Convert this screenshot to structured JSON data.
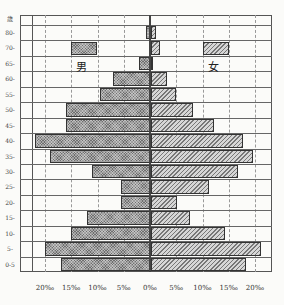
{
  "chart_data": {
    "type": "bar",
    "subtype": "population-pyramid",
    "title": "",
    "xlabel": "",
    "ylabel": "歳",
    "x_unit": "‰",
    "xlim": [
      -20,
      20
    ],
    "x_ticks": [
      "20‰",
      "15‰",
      "10‰",
      "5‰",
      "0‰",
      "5‰",
      "10‰",
      "15‰",
      "20‰"
    ],
    "grid": true,
    "legend": [
      {
        "name": "男",
        "pattern": "crosshatch-dark"
      },
      {
        "name": "女",
        "pattern": "diagonal-light"
      }
    ],
    "categories": [
      "80-",
      "70-",
      "65-",
      "60-",
      "55-",
      "50-",
      "45-",
      "40-",
      "35-",
      "30-",
      "25-",
      "20-",
      "15-",
      "10-",
      "5-",
      "0-5"
    ],
    "series": [
      {
        "name": "男",
        "side": "left",
        "values": [
          0.8,
          0.0,
          2.1,
          7.0,
          9.5,
          16.0,
          16.0,
          22.0,
          19.0,
          11.0,
          5.5,
          5.5,
          12.0,
          15.0,
          20.0,
          17.0
        ]
      },
      {
        "name": "女",
        "side": "right",
        "values": [
          1.0,
          1.8,
          0.3,
          3.0,
          4.8,
          8.0,
          12.0,
          17.5,
          19.5,
          16.5,
          11.0,
          5.0,
          7.5,
          14.0,
          21.0,
          18.0
        ]
      }
    ]
  },
  "labels": {
    "age_header": "歳",
    "male": "男",
    "female": "女"
  }
}
